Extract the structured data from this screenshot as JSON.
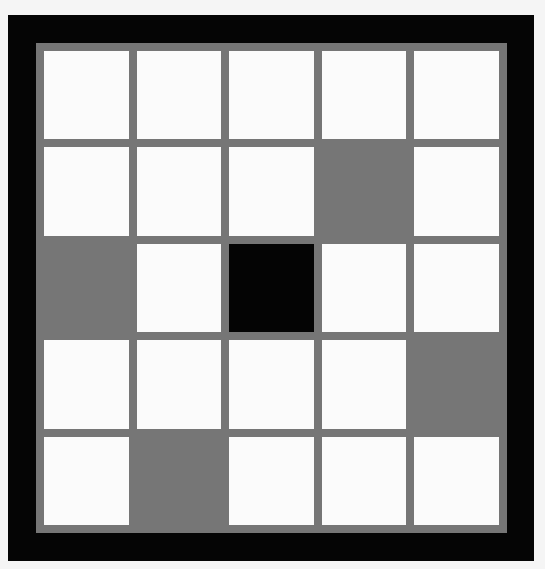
{
  "board": {
    "rows": 5,
    "cols": 5,
    "colors": {
      "background": "#f5f5f5",
      "border": "#050505",
      "grid_line": "#767676",
      "empty": "#fbfbfb",
      "gray": "#767676",
      "black": "#040404"
    },
    "cells": [
      [
        "empty",
        "empty",
        "empty",
        "empty",
        "empty"
      ],
      [
        "empty",
        "empty",
        "empty",
        "gray",
        "empty"
      ],
      [
        "gray",
        "empty",
        "black",
        "empty",
        "empty"
      ],
      [
        "empty",
        "empty",
        "empty",
        "empty",
        "gray"
      ],
      [
        "empty",
        "gray",
        "empty",
        "empty",
        "empty"
      ]
    ]
  }
}
